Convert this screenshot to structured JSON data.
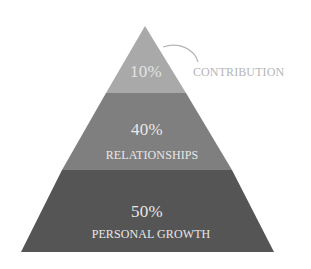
{
  "diagram": {
    "type": "pyramid",
    "tiers": [
      {
        "id": "contribution",
        "percent": "10%",
        "label": "CONTRIBUTION",
        "label_position": "outside-right",
        "fill": "#a9a9a9",
        "text_color": "#e4e4e4",
        "label_color": "#b5b5b5"
      },
      {
        "id": "relationships",
        "percent": "40%",
        "label": "RELATIONSHIPS",
        "label_position": "inside",
        "fill": "#7f7f7f",
        "text_color": "#e8e8e8"
      },
      {
        "id": "personal-growth",
        "percent": "50%",
        "label": "PERSONAL GROWTH",
        "label_position": "inside",
        "fill": "#555555",
        "text_color": "#e8e8e8"
      }
    ],
    "connector_color": "#b5b5b5"
  }
}
